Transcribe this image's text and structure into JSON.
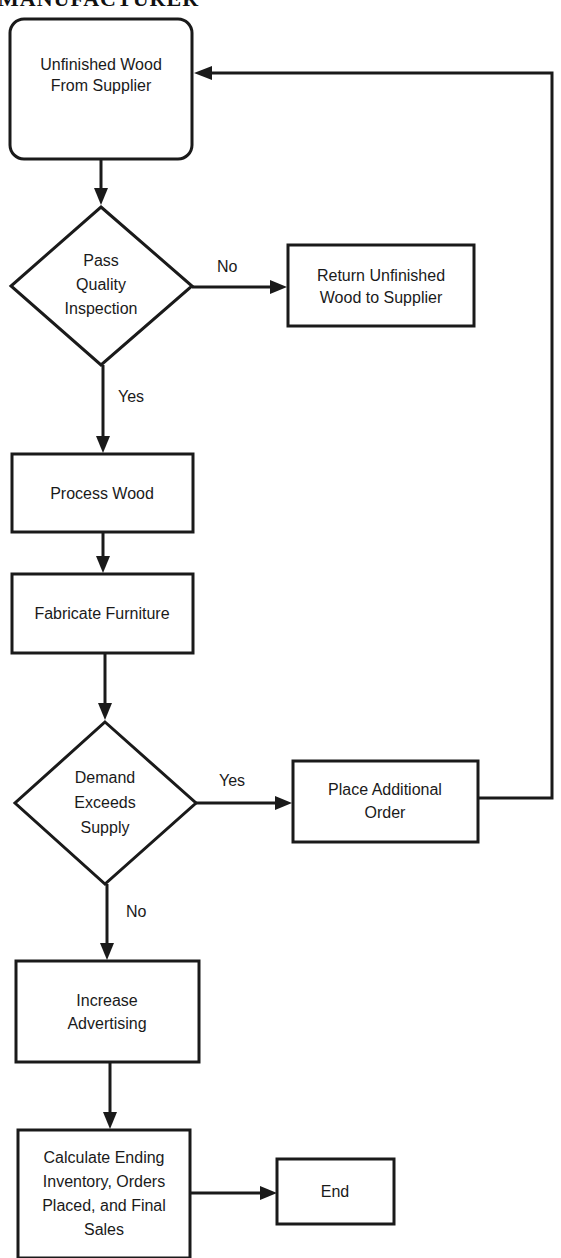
{
  "title": "MANUFACTURER",
  "nodes": {
    "start": {
      "lines": [
        "Unfinished Wood",
        "From Supplier"
      ]
    },
    "quality": {
      "lines": [
        "Pass",
        "Quality",
        "Inspection"
      ]
    },
    "return": {
      "lines": [
        "Return Unfinished",
        "Wood to Supplier"
      ]
    },
    "process": {
      "lines": [
        "Process Wood"
      ]
    },
    "fabricate": {
      "lines": [
        "Fabricate Furniture"
      ]
    },
    "demand": {
      "lines": [
        "Demand",
        "Exceeds",
        "Supply"
      ]
    },
    "order": {
      "lines": [
        "Place Additional",
        "Order"
      ]
    },
    "advertise": {
      "lines": [
        "Increase",
        "Advertising"
      ]
    },
    "calculate": {
      "lines": [
        "Calculate Ending",
        "Inventory, Orders",
        "Placed, and Final",
        "Sales"
      ]
    },
    "end": {
      "lines": [
        "End"
      ]
    }
  },
  "edges": {
    "quality_no": "No",
    "quality_yes": "Yes",
    "demand_yes": "Yes",
    "demand_no": "No"
  }
}
